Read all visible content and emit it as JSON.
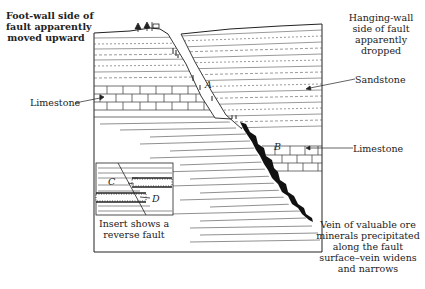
{
  "labels": {
    "footwall": [
      "Foot-wall side of",
      "fault apparently",
      "moved upward"
    ],
    "hangingwall": [
      "Hanging-wall",
      "side of fault",
      "apparently",
      "dropped"
    ],
    "sandstone": "Sandstone",
    "limestone_left": "Limestone",
    "limestone_right": "Limestone",
    "point_a": "A",
    "point_b": "B",
    "point_c": "C",
    "point_d": "D",
    "insert": [
      "Insert shows a",
      "reverse fault"
    ],
    "vein": [
      "Vein of valuable ore",
      "minerals precipitated",
      "along the fault",
      "surface–vein widens",
      "and narrows"
    ]
  },
  "colors": {
    "ink": "#222222",
    "background": "#ffffff"
  }
}
